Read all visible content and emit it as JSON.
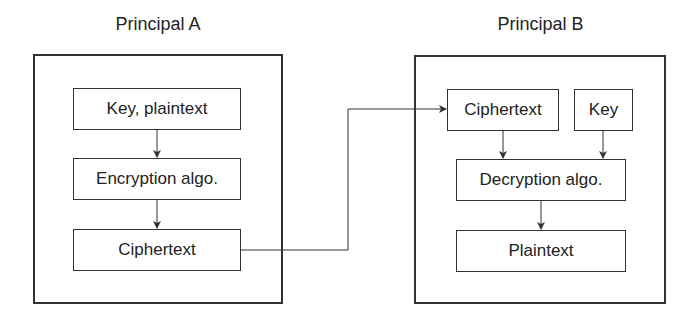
{
  "principal_a": {
    "title": "Principal A",
    "boxes": [
      "Key, plaintext",
      "Encryption algo.",
      "Ciphertext"
    ]
  },
  "principal_b": {
    "title": "Principal B",
    "boxes": [
      "Ciphertext",
      "Key",
      "Decryption algo.",
      "Plaintext"
    ]
  },
  "colors": {
    "stroke": "#333333",
    "background": "#ffffff"
  }
}
